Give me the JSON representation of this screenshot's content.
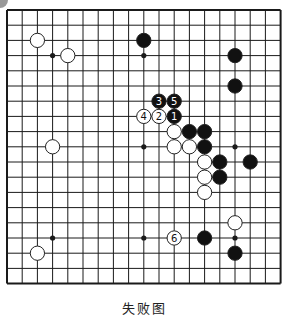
{
  "diagram": {
    "type": "go-board",
    "size": 19,
    "caption": "失败图",
    "colors": {
      "background": "#ffffff",
      "grid": "#1a1a1a",
      "black_stone": "#111111",
      "white_stone": "#ffffff",
      "stone_outline": "#222222",
      "corner_blob": "#9a9a9a"
    },
    "grid": {
      "origin_x": 7,
      "origin_y": 10,
      "spacing": 15.2
    },
    "hoshi": [
      [
        3,
        3
      ],
      [
        9,
        3
      ],
      [
        15,
        3
      ],
      [
        3,
        9
      ],
      [
        9,
        9
      ],
      [
        15,
        9
      ],
      [
        3,
        15
      ],
      [
        9,
        15
      ],
      [
        15,
        15
      ]
    ],
    "stones": [
      {
        "color": "white",
        "col": 2,
        "row": 2,
        "label": ""
      },
      {
        "color": "white",
        "col": 4,
        "row": 3,
        "label": ""
      },
      {
        "color": "black",
        "col": 9,
        "row": 2,
        "label": ""
      },
      {
        "color": "black",
        "col": 15,
        "row": 3,
        "label": ""
      },
      {
        "color": "black",
        "col": 15,
        "row": 5,
        "label": ""
      },
      {
        "color": "black",
        "col": 10,
        "row": 6,
        "label": "3"
      },
      {
        "color": "black",
        "col": 11,
        "row": 6,
        "label": "5"
      },
      {
        "color": "white",
        "col": 9,
        "row": 7,
        "label": "4"
      },
      {
        "color": "white",
        "col": 10,
        "row": 7,
        "label": "2"
      },
      {
        "color": "black",
        "col": 11,
        "row": 7,
        "label": "1"
      },
      {
        "color": "white",
        "col": 11,
        "row": 8,
        "label": ""
      },
      {
        "color": "black",
        "col": 12,
        "row": 8,
        "label": ""
      },
      {
        "color": "black",
        "col": 13,
        "row": 8,
        "label": ""
      },
      {
        "color": "white",
        "col": 11,
        "row": 9,
        "label": ""
      },
      {
        "color": "white",
        "col": 12,
        "row": 9,
        "label": ""
      },
      {
        "color": "black",
        "col": 13,
        "row": 9,
        "label": ""
      },
      {
        "color": "white",
        "col": 13,
        "row": 10,
        "label": ""
      },
      {
        "color": "black",
        "col": 14,
        "row": 10,
        "label": ""
      },
      {
        "color": "black",
        "col": 16,
        "row": 10,
        "label": ""
      },
      {
        "color": "white",
        "col": 13,
        "row": 11,
        "label": ""
      },
      {
        "color": "black",
        "col": 14,
        "row": 11,
        "label": ""
      },
      {
        "color": "white",
        "col": 13,
        "row": 12,
        "label": ""
      },
      {
        "color": "white",
        "col": 3,
        "row": 9,
        "label": ""
      },
      {
        "color": "white",
        "col": 15,
        "row": 14,
        "label": ""
      },
      {
        "color": "white",
        "col": 11,
        "row": 15,
        "label": "6"
      },
      {
        "color": "black",
        "col": 13,
        "row": 15,
        "label": ""
      },
      {
        "color": "black",
        "col": 15,
        "row": 16,
        "label": ""
      },
      {
        "color": "white",
        "col": 2,
        "row": 16,
        "label": ""
      }
    ]
  }
}
